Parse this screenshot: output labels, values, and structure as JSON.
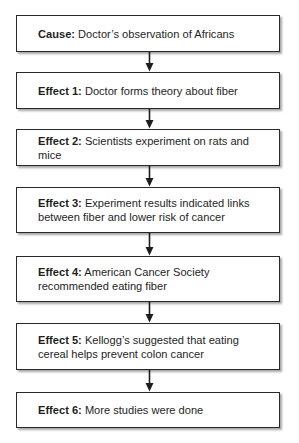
{
  "diagram": {
    "type": "cause-effect-flowchart",
    "colors": {
      "border": "#2a2a2a",
      "text": "#1e1e1e",
      "background": "#ffffff"
    },
    "nodes": [
      {
        "label": "Cause:",
        "text": "Doctor’s observation of Africans"
      },
      {
        "label": "Effect 1:",
        "text": "Doctor forms theory about fiber"
      },
      {
        "label": "Effect 2:",
        "text": "Scientists experiment on rats and mice"
      },
      {
        "label": "Effect 3:",
        "text": "Experiment results indicated links between fiber and lower risk of cancer"
      },
      {
        "label": "Effect 4:",
        "text": "American Cancer Society recommended eating fiber"
      },
      {
        "label": "Effect 5:",
        "text": "Kellogg’s suggested that eating cereal helps prevent colon cancer"
      },
      {
        "label": "Effect 6:",
        "text": "More studies were done"
      }
    ],
    "edges": [
      {
        "from": 0,
        "to": 1,
        "icon": "arrow-down-icon"
      },
      {
        "from": 1,
        "to": 2,
        "icon": "arrow-down-icon"
      },
      {
        "from": 2,
        "to": 3,
        "icon": "arrow-down-icon"
      },
      {
        "from": 3,
        "to": 4,
        "icon": "arrow-down-icon"
      },
      {
        "from": 4,
        "to": 5,
        "icon": "arrow-down-icon"
      },
      {
        "from": 5,
        "to": 6,
        "icon": "arrow-down-icon"
      }
    ]
  }
}
